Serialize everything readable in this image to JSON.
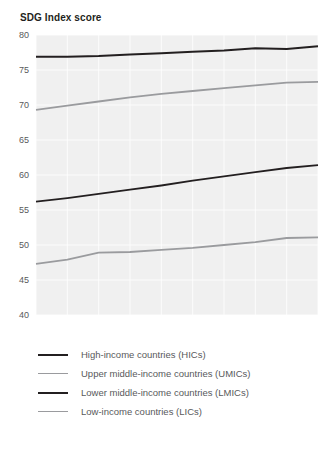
{
  "chart_data": {
    "type": "line",
    "title": "SDG Index score",
    "xlabel": "",
    "ylabel": "",
    "grid": true,
    "legend_position": "bottom",
    "x": [
      2010,
      2011,
      2012,
      2013,
      2014,
      2015,
      2016,
      2017,
      2018,
      2019
    ],
    "xlim": [
      2010,
      2019
    ],
    "ylim": [
      40,
      80
    ],
    "yticks": [
      40,
      45,
      50,
      55,
      60,
      65,
      70,
      75,
      80
    ],
    "xticks": [
      2010,
      2011,
      2012,
      2013,
      2014,
      2015,
      2016,
      2017,
      2018,
      2019
    ],
    "ytick_labels": [
      "40",
      "45",
      "50",
      "55",
      "60",
      "65",
      "70",
      "75",
      "80"
    ],
    "xtick_labels": [
      "2010",
      "2011",
      "2012",
      "2013",
      "2014",
      "2015",
      "2016",
      "2017",
      "2018",
      "2019"
    ],
    "series": [
      {
        "name": "High-income countries (HICs)",
        "color": "#231f20",
        "width": 2.0,
        "values": [
          76.9,
          76.9,
          77.0,
          77.2,
          77.4,
          77.6,
          77.8,
          78.1,
          78.0,
          78.4
        ]
      },
      {
        "name": "Upper middle-income countries (UMICs)",
        "color": "#9a9b9e",
        "width": 1.8,
        "values": [
          69.3,
          69.9,
          70.5,
          71.1,
          71.6,
          72.0,
          72.4,
          72.8,
          73.2,
          73.3
        ]
      },
      {
        "name": "Lower middle-income countries (LMICs)",
        "color": "#231f20",
        "width": 1.8,
        "values": [
          56.2,
          56.7,
          57.3,
          57.9,
          58.5,
          59.2,
          59.8,
          60.4,
          61.0,
          61.4
        ]
      },
      {
        "name": "Low-income countries (LICs)",
        "color": "#9a9b9e",
        "width": 1.8,
        "values": [
          47.3,
          47.9,
          48.9,
          49.0,
          49.3,
          49.6,
          50.0,
          50.4,
          51.0,
          51.1
        ]
      }
    ]
  },
  "legend": {
    "items": [
      {
        "label": "High-income countries (HICs)",
        "color": "#231f20",
        "width": 2.2
      },
      {
        "label": "Upper middle-income countries (UMICs)",
        "color": "#9a9b9e",
        "width": 1.8
      },
      {
        "label": "Lower middle-income countries (LMICs)",
        "color": "#231f20",
        "width": 2.2
      },
      {
        "label": "Low-income countries (LICs)",
        "color": "#9a9b9e",
        "width": 1.8
      }
    ]
  },
  "plot_style": {
    "background": "#f0f0f0",
    "gridline_color": "#ffffff",
    "tick_label_color": "#58595b"
  }
}
